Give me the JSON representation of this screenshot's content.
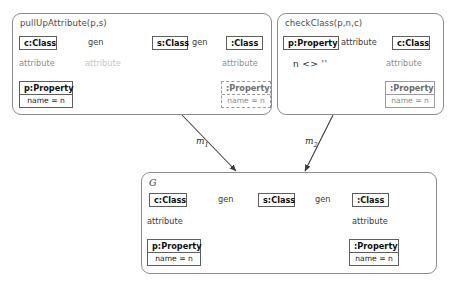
{
  "diagram": {
    "kind": "graph-transformation-rule-match",
    "colors": {
      "panel_border": "#8c8c8c",
      "node_border": "#5e5e5e",
      "edge_solid": "#6e6e6e",
      "edge_dotted": "#9b9b9b",
      "edge_faded": "#d2d2d2",
      "text": "#1a1a1a",
      "label_grey": "#c6c6c6",
      "morphism": "#3a3a3a"
    },
    "panels": [
      {
        "id": "pullUpAttribute",
        "title": "pullUpAttribute(p,s)",
        "nodes": [
          {
            "id": "p1-c-class",
            "header": "c:Class",
            "attribute": null,
            "style": "solid"
          },
          {
            "id": "p1-s-class",
            "header": "s:Class",
            "attribute": null,
            "style": "solid"
          },
          {
            "id": "p1-class",
            "header": ":Class",
            "attribute": null,
            "style": "solid"
          },
          {
            "id": "p1-p-prop",
            "header": "p:Property",
            "attribute": "name = n",
            "style": "solid"
          },
          {
            "id": "p1-prop",
            "header": ":Property",
            "attribute": "name = n",
            "style": "dashed"
          }
        ],
        "edges": [
          {
            "id": "p1-gen-1",
            "label": "gen",
            "from": "c:Class",
            "to": "s:Class",
            "style": "solid"
          },
          {
            "id": "p1-gen-2",
            "label": "gen",
            "from": ":Class",
            "to": "s:Class",
            "style": "solid"
          },
          {
            "id": "p1-attr-1",
            "label": "attribute",
            "from": "c:Class",
            "to": "p:Property",
            "style": "dotted"
          },
          {
            "id": "p1-attr-2",
            "label": "attribute",
            "from": "s:Class",
            "to": "p:Property",
            "style": "faded"
          },
          {
            "id": "p1-attr-3",
            "label": "attribute",
            "from": ":Class",
            "to": ":Property",
            "style": "dotted"
          }
        ]
      },
      {
        "id": "checkClass",
        "title": "checkClass(p,n,c)",
        "constraint": "n <> ''",
        "nodes": [
          {
            "id": "p2-p-prop",
            "header": "p:Property",
            "attribute": null,
            "style": "solid"
          },
          {
            "id": "p2-c-class",
            "header": "c:Class",
            "attribute": null,
            "style": "solid"
          },
          {
            "id": "p2-prop",
            "header": ":Property",
            "attribute": "name = n",
            "style": "negated"
          }
        ],
        "edges": [
          {
            "id": "p2-attr-1",
            "label": "attribute",
            "from": "c:Class",
            "to": "p:Property",
            "style": "solid"
          },
          {
            "id": "p2-attr-2",
            "label": "attribute",
            "from": "c:Class",
            "to": ":Property",
            "style": "dotted",
            "negated": true
          }
        ]
      },
      {
        "id": "host-graph",
        "title": "G",
        "nodes": [
          {
            "id": "g-c-class",
            "header": "c:Class",
            "attribute": null,
            "style": "solid"
          },
          {
            "id": "g-s-class",
            "header": "s:Class",
            "attribute": null,
            "style": "solid"
          },
          {
            "id": "g-class",
            "header": ":Class",
            "attribute": null,
            "style": "solid"
          },
          {
            "id": "g-p-prop",
            "header": "p:Property",
            "attribute": "name = n",
            "style": "solid"
          },
          {
            "id": "g-prop",
            "header": ":Property",
            "attribute": "name = n",
            "style": "solid"
          }
        ],
        "edges": [
          {
            "id": "g-gen-1",
            "label": "gen",
            "from": "c:Class",
            "to": "s:Class",
            "style": "solid"
          },
          {
            "id": "g-gen-2",
            "label": "gen",
            "from": ":Class",
            "to": "s:Class",
            "style": "solid"
          },
          {
            "id": "g-attr-1",
            "label": "attribute",
            "from": "c:Class",
            "to": "p:Property",
            "style": "solid"
          },
          {
            "id": "g-attr-2",
            "label": "attribute",
            "from": ":Class",
            "to": ":Property",
            "style": "solid"
          }
        ]
      }
    ],
    "morphisms": [
      {
        "id": "m1",
        "label": "m",
        "subscript": "1",
        "from": "pullUpAttribute",
        "to": "host-graph"
      },
      {
        "id": "m2",
        "label": "m",
        "subscript": "2",
        "from": "checkClass",
        "to": "host-graph"
      }
    ]
  }
}
